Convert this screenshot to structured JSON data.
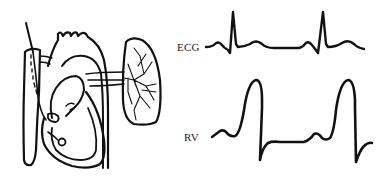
{
  "figure": {
    "type": "medical-diagram",
    "illustration": {
      "subject": "heart-with-right-heart-catheter",
      "parts": [
        "catheter",
        "superior-vena-cava",
        "right-atrium",
        "right-ventricle",
        "aortic-arch",
        "pulmonary-artery",
        "lung"
      ]
    },
    "traces": [
      {
        "label": "ECG",
        "kind": "electrocardiogram",
        "beats": 2
      },
      {
        "label": "RV",
        "kind": "right-ventricular-pressure",
        "beats": 2
      }
    ],
    "colors": {
      "background": "#ffffff",
      "ink": "#111111"
    }
  }
}
